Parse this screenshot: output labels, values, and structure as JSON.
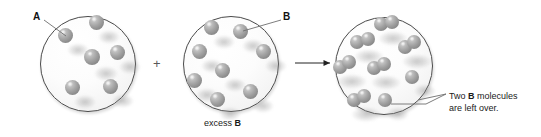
{
  "figure": {
    "type": "chemistry-limiting-reactant-diagram",
    "operator_plus": "+",
    "labels": {
      "reactant_a": "A",
      "reactant_b": "B",
      "excess_caption_prefix": "excess ",
      "excess_caption_species": "B",
      "leftover_line1_prefix": "Two ",
      "leftover_line1_species": "B",
      "leftover_line1_suffix": " molecules",
      "leftover_line2": "are left over."
    },
    "colors": {
      "sphere_base": "#a2a2a2",
      "sphere_dark": "#7d7d7d",
      "sphere_light": "#d8d8d8",
      "vessel_outline": "#4a4a4a",
      "vessel_fill": "#fbfbfb",
      "text": "#111111",
      "leader_line": "#6e6e6e"
    },
    "panels": [
      {
        "name": "reactant-a-vessel",
        "cx": 87,
        "cy": 63,
        "r": 47,
        "species": "A",
        "count": 6,
        "spheres": [
          {
            "x": 65,
            "y": 35,
            "d": 15
          },
          {
            "x": 96,
            "y": 22,
            "d": 15
          },
          {
            "x": 92,
            "y": 57,
            "d": 16
          },
          {
            "x": 117,
            "y": 52,
            "d": 15
          },
          {
            "x": 72,
            "y": 87,
            "d": 15
          },
          {
            "x": 110,
            "y": 86,
            "d": 15
          }
        ]
      },
      {
        "name": "reactant-b-vessel",
        "cx": 230,
        "cy": 63,
        "r": 47,
        "species": "B",
        "count": 8,
        "caption": "excess B",
        "spheres": [
          {
            "x": 211,
            "y": 27,
            "d": 15
          },
          {
            "x": 240,
            "y": 31,
            "d": 15
          },
          {
            "x": 199,
            "y": 51,
            "d": 15
          },
          {
            "x": 263,
            "y": 51,
            "d": 15
          },
          {
            "x": 222,
            "y": 70,
            "d": 15
          },
          {
            "x": 194,
            "y": 80,
            "d": 15
          },
          {
            "x": 250,
            "y": 91,
            "d": 15
          },
          {
            "x": 217,
            "y": 99,
            "d": 15
          }
        ]
      },
      {
        "name": "product-vessel",
        "cx": 383,
        "cy": 65,
        "r": 48,
        "product_pairs": 6,
        "leftover_singles": 2,
        "pairs": [
          {
            "x1": 381,
            "y1": 24,
            "x2": 392,
            "y2": 22,
            "d": 14
          },
          {
            "x1": 357,
            "y1": 42,
            "x2": 368,
            "y2": 39,
            "d": 14
          },
          {
            "x1": 405,
            "y1": 47,
            "x2": 414,
            "y2": 42,
            "d": 14
          },
          {
            "x1": 340,
            "y1": 67,
            "x2": 349,
            "y2": 62,
            "d": 14
          },
          {
            "x1": 374,
            "y1": 68,
            "x2": 384,
            "y2": 64,
            "d": 14
          },
          {
            "x1": 354,
            "y1": 100,
            "x2": 364,
            "y2": 96,
            "d": 14
          }
        ],
        "singles": [
          {
            "x": 412,
            "y": 77,
            "d": 14
          },
          {
            "x": 385,
            "y": 100,
            "d": 14
          }
        ]
      }
    ]
  }
}
